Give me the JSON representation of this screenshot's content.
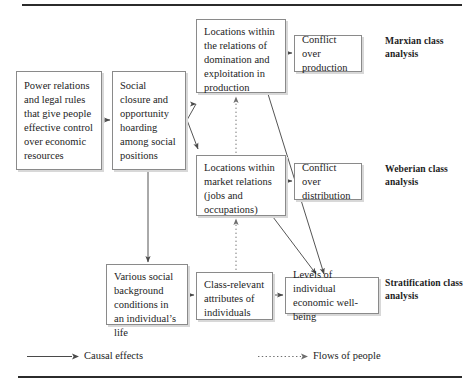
{
  "figure": {
    "boxes": {
      "power_relations": "Power relations and legal rules that give people effective control over economic resources",
      "social_closure": "Social closure and opportunity hoarding among social positions",
      "locations_production": "Locations within the relations of domination and exploitation in production",
      "conflict_production": "Conflict over production",
      "locations_market": "Locations within market relations (jobs and occupations)",
      "conflict_distribution": "Conflict over distribution",
      "social_background": "Various social background conditions in an individual’s life",
      "class_attributes": "Class-relevant attributes of individuals",
      "wellbeing": "Levels of individual economic well-being"
    },
    "side_labels": {
      "marxian": "Marxian class analysis",
      "weberian": "Weberian class analysis",
      "stratification": "Stratification class analysis"
    },
    "legend": {
      "causal": "Causal effects",
      "flows": "Flows of people"
    },
    "colors": {
      "box_border": "#8a8a8a",
      "box_shadow": "#d8d8d8",
      "line": "#555555",
      "rule": "#2b2b2b",
      "text": "#1d1d1d"
    }
  }
}
